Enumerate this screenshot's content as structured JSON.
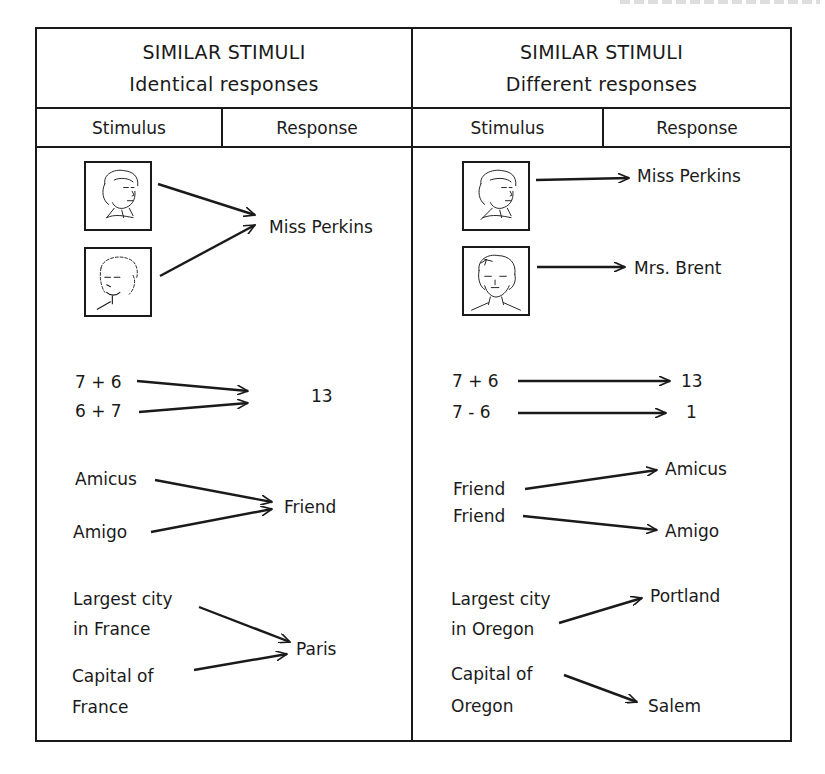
{
  "panels": [
    {
      "title": "SIMILAR STIMULI",
      "subtitle": "Identical responses",
      "columns": [
        "Stimulus",
        "Response"
      ],
      "rows": {
        "faces": {
          "stimuli": [
            "face-woman-1",
            "face-woman-2"
          ],
          "responses": [
            "Miss Perkins"
          ]
        },
        "arithmetic": {
          "stimuli": [
            "7 + 6",
            "6 + 7"
          ],
          "responses": [
            "13"
          ]
        },
        "words": {
          "stimuli": [
            "Amicus",
            "Amigo"
          ],
          "responses": [
            "Friend"
          ]
        },
        "geography": {
          "stimuli": [
            [
              "Largest city",
              "in France"
            ],
            [
              "Capital of",
              "France"
            ]
          ],
          "responses": [
            "Paris"
          ]
        }
      }
    },
    {
      "title": "SIMILAR STIMULI",
      "subtitle": "Different responses",
      "columns": [
        "Stimulus",
        "Response"
      ],
      "rows": {
        "faces": {
          "stimuli": [
            "face-woman-1",
            "face-woman-3"
          ],
          "responses": [
            "Miss Perkins",
            "Mrs. Brent"
          ]
        },
        "arithmetic": {
          "stimuli": [
            "7 + 6",
            "7 - 6"
          ],
          "responses": [
            "13",
            "1"
          ]
        },
        "words": {
          "stimuli": [
            "Friend",
            "Friend"
          ],
          "responses": [
            "Amicus",
            "Amigo"
          ]
        },
        "geography": {
          "stimuli": [
            [
              "Largest city",
              "in Oregon"
            ],
            [
              "Capital of",
              "Oregon"
            ]
          ],
          "responses": [
            "Portland",
            "Salem"
          ]
        }
      }
    }
  ],
  "colors": {
    "ink": "#1a1a1a",
    "paper": "#ffffff"
  }
}
